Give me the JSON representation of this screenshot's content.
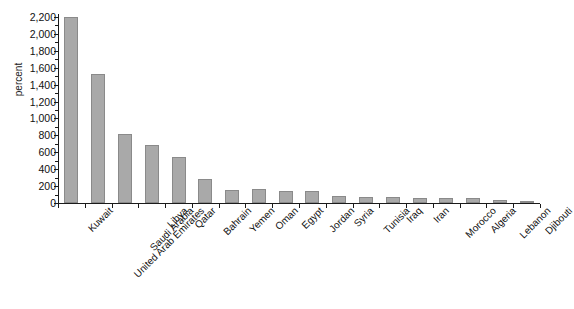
{
  "chart_data": {
    "type": "bar",
    "title": "",
    "xlabel": "",
    "ylabel": "percent",
    "ylim": [
      0,
      2200
    ],
    "ytick_step": 200,
    "grid": false,
    "legend": "none",
    "bar_color": "#a9a9a9",
    "bar_border_color": "#8a8a8a",
    "categories": [
      "Kuwait",
      "United Arab Emirates",
      "Saudi Arabia",
      "Libya",
      "Qatar",
      "Bahrain",
      "Yemen",
      "Oman",
      "Egypt",
      "Jordan",
      "Syria",
      "Tunisia",
      "Iraq",
      "Iran",
      "Morocco",
      "Algeria",
      "Lebanon",
      "Djibouti"
    ],
    "values": [
      2200,
      1530,
      820,
      690,
      540,
      280,
      150,
      160,
      140,
      140,
      80,
      70,
      70,
      60,
      60,
      55,
      40,
      10
    ],
    "ytick_labels": [
      "0",
      "200",
      "400",
      "600",
      "800",
      "1,000",
      "1,200",
      "1,400",
      "1,600",
      "1,800",
      "2,000",
      "2,200"
    ]
  }
}
